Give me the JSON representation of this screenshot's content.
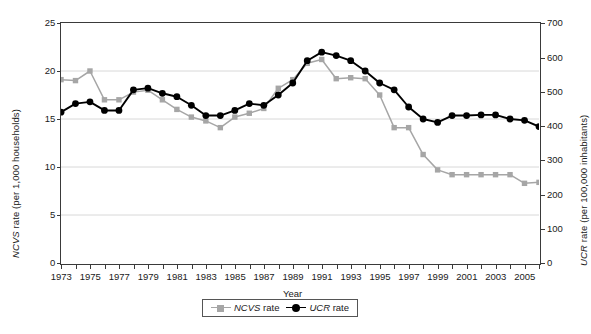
{
  "chart_data": {
    "type": "line",
    "title": "",
    "xlabel": "Year",
    "ylabel": "NCVS rate  (per 1,000 households)",
    "ylabel_right": "UCR rate  (per 100,000 inhabitants)",
    "x": [
      1973,
      1974,
      1975,
      1976,
      1977,
      1978,
      1979,
      1980,
      1981,
      1982,
      1983,
      1984,
      1985,
      1986,
      1987,
      1988,
      1989,
      1990,
      1991,
      1992,
      1993,
      1994,
      1995,
      1996,
      1997,
      1998,
      1999,
      2000,
      2001,
      2002,
      2003,
      2004,
      2005,
      2006
    ],
    "xlim": [
      1973,
      2006
    ],
    "xtick_labels": [
      "1973",
      "1975",
      "1977",
      "1979",
      "1981",
      "1983",
      "1985",
      "1987",
      "1989",
      "1991",
      "1993",
      "1995",
      "1997",
      "1999",
      "2001",
      "2003",
      "2005"
    ],
    "ylim": [
      0,
      25
    ],
    "ytick_labels": [
      "0",
      "5",
      "10",
      "15",
      "20",
      "25"
    ],
    "ylim_right": [
      0,
      700
    ],
    "ytick_labels_right": [
      "0",
      "100",
      "200",
      "300",
      "400",
      "500",
      "600",
      "700"
    ],
    "grid": "horizontal",
    "legend_position": "bottom-center",
    "series": [
      {
        "name": "NCVS rate",
        "axis": "left",
        "color": "#a6a6a6",
        "marker": "square",
        "units": "per 1,000 households",
        "values": [
          19.1,
          19.0,
          20.0,
          17.0,
          17.0,
          17.8,
          18.0,
          17.0,
          16.0,
          15.2,
          14.8,
          14.1,
          15.2,
          15.6,
          16.1,
          18.2,
          19.1,
          20.8,
          21.2,
          19.2,
          19.3,
          19.2,
          17.5,
          14.1,
          14.1,
          11.3,
          9.7,
          9.2,
          9.2,
          9.2,
          9.2,
          9.2,
          8.3,
          8.4
        ]
      },
      {
        "name": "UCR rate",
        "axis": "right",
        "color": "#000000",
        "marker": "circle",
        "units": "per 100,000 inhabitants",
        "values": [
          440,
          465,
          470,
          445,
          445,
          505,
          510,
          495,
          485,
          460,
          430,
          430,
          445,
          465,
          460,
          490,
          525,
          590,
          615,
          605,
          590,
          560,
          525,
          505,
          455,
          420,
          410,
          430,
          430,
          432,
          432,
          420,
          416,
          398
        ]
      }
    ]
  },
  "axis": {
    "left_label_prefix": "NCVS",
    "left_label_rest": " rate  (per 1,000 households)",
    "right_label_prefix": "UCR",
    "right_label_rest": " rate  (per 100,000 inhabitants)",
    "x_label": "Year"
  },
  "legend": {
    "items": [
      {
        "marker_name": "square-marker",
        "prefix": "NCVS",
        "rest": " rate"
      },
      {
        "marker_name": "circle-marker",
        "prefix": "UCR",
        "rest": " rate"
      }
    ]
  }
}
